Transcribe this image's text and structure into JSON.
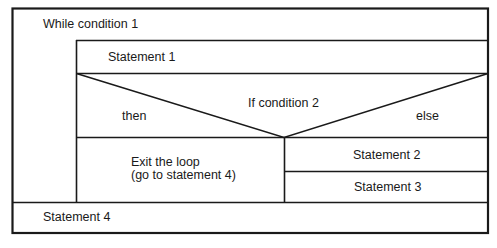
{
  "diagram": {
    "type": "Nassi-Shneiderman structogram",
    "loop": {
      "label": "While condition 1"
    },
    "statement1": {
      "label": "Statement 1"
    },
    "if_block": {
      "condition": "If condition 2",
      "then_label": "then",
      "else_label": "else",
      "then_branch": {
        "line1": "Exit the loop",
        "line2": "(go to statement 4)"
      },
      "else_branch": [
        {
          "label": "Statement 2"
        },
        {
          "label": "Statement 3"
        }
      ]
    },
    "statement4": {
      "label": "Statement 4"
    },
    "colors": {
      "line": "#1a1a1a",
      "background": "#ffffff"
    }
  }
}
